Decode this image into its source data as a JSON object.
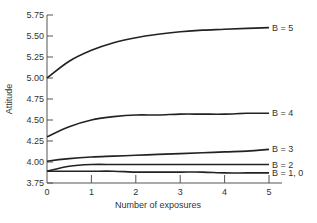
{
  "chart_data": {
    "type": "line",
    "title": "",
    "xlabel": "Number of exposures",
    "ylabel": "Attitude",
    "xlim": [
      0,
      5
    ],
    "ylim": [
      3.75,
      5.75
    ],
    "grid": false,
    "legend_position": "inline-right",
    "x_ticks": [
      "0",
      "1",
      "2",
      "3",
      "4",
      "5"
    ],
    "y_ticks": [
      "3.75",
      "4.00",
      "4.25",
      "4.50",
      "4.75",
      "5.00",
      "5.25",
      "5.50",
      "5.75"
    ],
    "x": [
      0,
      0.5,
      1,
      1.5,
      2,
      2.5,
      3,
      3.5,
      4,
      4.5,
      5
    ],
    "series": [
      {
        "name": "B = 5",
        "values": [
          5.0,
          5.2,
          5.33,
          5.42,
          5.48,
          5.52,
          5.55,
          5.57,
          5.58,
          5.59,
          5.6
        ]
      },
      {
        "name": "B = 4",
        "values": [
          4.3,
          4.42,
          4.5,
          4.54,
          4.56,
          4.56,
          4.57,
          4.57,
          4.57,
          4.58,
          4.58
        ]
      },
      {
        "name": "B = 3",
        "values": [
          4.01,
          4.04,
          4.06,
          4.07,
          4.08,
          4.09,
          4.1,
          4.11,
          4.12,
          4.13,
          4.15
        ]
      },
      {
        "name": "B = 2",
        "values": [
          3.89,
          3.95,
          3.97,
          3.97,
          3.97,
          3.97,
          3.97,
          3.97,
          3.97,
          3.97,
          3.97
        ]
      },
      {
        "name": "B = 1, 0",
        "values": [
          3.89,
          3.89,
          3.89,
          3.89,
          3.88,
          3.88,
          3.88,
          3.88,
          3.87,
          3.87,
          3.87
        ]
      }
    ]
  },
  "layout": {
    "line_color": "#222222",
    "axis_color": "#555555"
  }
}
